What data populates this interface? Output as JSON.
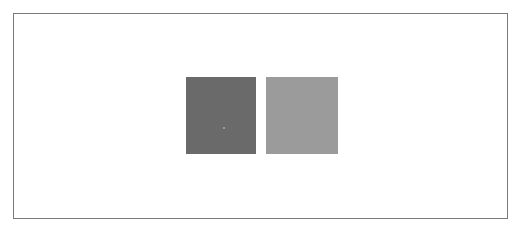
{
  "canvas": {
    "border_color": "#7a7a7a",
    "background": "#ffffff"
  },
  "swatches": [
    {
      "name": "dark-gray",
      "color": "#6a6a6a"
    },
    {
      "name": "light-gray",
      "color": "#9b9b9b"
    }
  ]
}
